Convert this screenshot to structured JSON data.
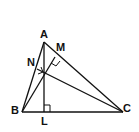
{
  "diagram": {
    "points": {
      "A": {
        "label": "A"
      },
      "B": {
        "label": "B"
      },
      "C": {
        "label": "C"
      },
      "L": {
        "label": "L"
      },
      "M": {
        "label": "M"
      },
      "N": {
        "label": "N"
      }
    },
    "segments": [
      "AB",
      "BC",
      "CA",
      "AL",
      "BM",
      "CN"
    ],
    "right_angles": [
      "L",
      "M",
      "N"
    ],
    "colors": {
      "stroke": "#111111",
      "background": "#ffffff"
    }
  }
}
